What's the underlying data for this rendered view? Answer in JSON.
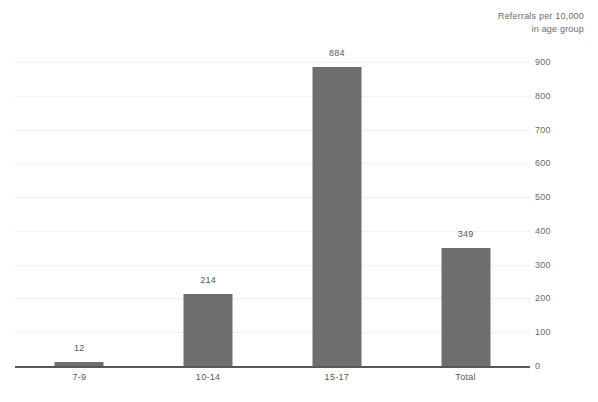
{
  "chart_data": {
    "type": "bar",
    "title": "",
    "subtitle": "",
    "xlabel": "",
    "ylabel": "Referrals per 10,000\nin age group",
    "categories": [
      "7-9",
      "10-14",
      "15-17",
      "Total"
    ],
    "values": [
      12,
      214,
      884,
      349
    ],
    "value_labels": [
      "12",
      "214",
      "884",
      "349"
    ],
    "ylim": [
      0,
      900
    ],
    "ytick_labels": [
      "0",
      "100",
      "200",
      "300",
      "400",
      "500",
      "600",
      "700",
      "800",
      "900"
    ],
    "ytick_values": [
      0,
      100,
      200,
      300,
      400,
      500,
      600,
      700,
      800,
      900
    ],
    "grid": true,
    "legend": false,
    "legend_position": "none",
    "series": [
      {
        "name": "Referrals per 10,000 in age group",
        "values": [
          12,
          214,
          884,
          349
        ],
        "color": "#6e6e6e"
      }
    ],
    "colors": {
      "bar": "#6e6e6e",
      "gridline": "#f1f1f1",
      "axis": "#58585a",
      "text": "#58585a",
      "background": "#ffffff"
    }
  }
}
